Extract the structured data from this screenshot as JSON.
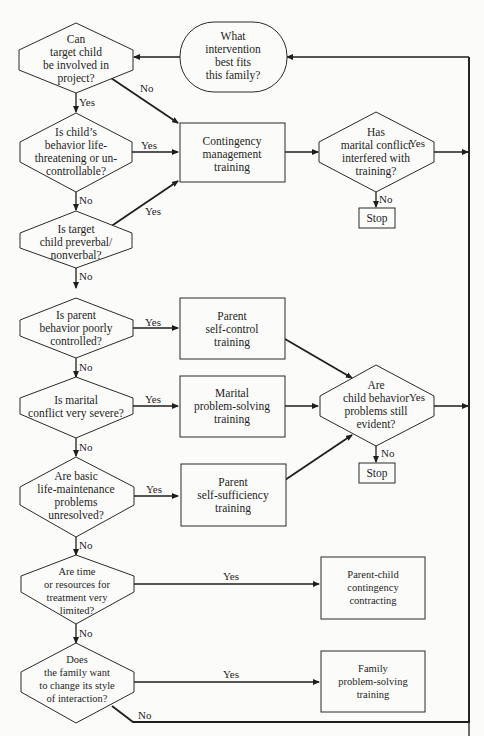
{
  "header": {
    "text": ""
  },
  "start": {
    "lines": [
      "What",
      "intervention",
      "best fits",
      "this family?"
    ]
  },
  "decisions": {
    "d1": {
      "lines": [
        "Can",
        "target child",
        "be involved in",
        "project?"
      ]
    },
    "d2": {
      "lines": [
        "Is child’s",
        "behavior life-",
        "threatening or un-",
        "controllable?"
      ]
    },
    "d3": {
      "lines": [
        "Is target",
        "child preverbal/",
        "nonverbal?"
      ]
    },
    "d4": {
      "lines": [
        "Is parent",
        "behavior poorly",
        "controlled?"
      ]
    },
    "d5": {
      "lines": [
        "Is marital",
        "conflict very severe?"
      ]
    },
    "d6": {
      "lines": [
        "Are basic",
        "life-maintenance",
        "problems",
        "unresolved?"
      ]
    },
    "d7": {
      "lines": [
        "Are time",
        "or resources for",
        "treatment very",
        "limited?"
      ]
    },
    "d8": {
      "lines": [
        "Does",
        "the family want",
        "to change its style",
        "of interaction?"
      ]
    },
    "m1": {
      "lines": [
        "Has",
        "marital conflict",
        "interfered with",
        "training?"
      ]
    },
    "m2": {
      "lines": [
        "Are",
        "child behavior",
        "problems still",
        "evident?"
      ]
    }
  },
  "processes": {
    "p1": {
      "lines": [
        "Contingency",
        "management",
        "training"
      ]
    },
    "p2": {
      "lines": [
        "Parent",
        "self-control",
        "training"
      ]
    },
    "p3": {
      "lines": [
        "Marital",
        "problem-solving",
        "training"
      ]
    },
    "p4": {
      "lines": [
        "Parent",
        "self-sufficiency",
        "training"
      ]
    },
    "p5": {
      "lines": [
        "Parent-child",
        "contingency",
        "contracting"
      ]
    },
    "p6": {
      "lines": [
        "Family",
        "problem-solving",
        "training"
      ]
    }
  },
  "terminals": {
    "stop1": "Stop",
    "stop2": "Stop"
  },
  "edge_labels": {
    "yes": "Yes",
    "no": "No"
  }
}
